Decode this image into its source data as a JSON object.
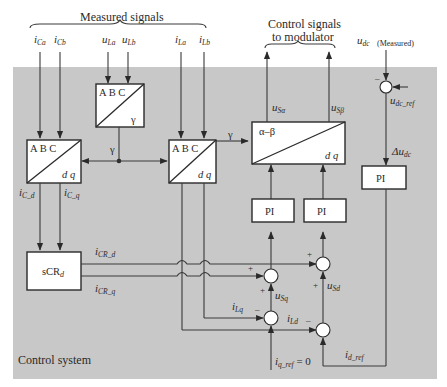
{
  "header": {
    "measured_signals": "Measured signals",
    "control_signals_line1": "Control signals",
    "control_signals_line2": "to modulator",
    "udc_measured_main": "u",
    "udc_measured_sub": "dc",
    "udc_measured_note": "(Measured)"
  },
  "region": {
    "label": "Control system",
    "background": "#c8c8c8"
  },
  "inputs": {
    "iCa": {
      "main": "i",
      "sub": "Ca"
    },
    "iCb": {
      "main": "i",
      "sub": "Cb"
    },
    "uLa": {
      "main": "u",
      "sub": "La"
    },
    "uLb": {
      "main": "u",
      "sub": "Lb"
    },
    "iLa": {
      "main": "i",
      "sub": "La"
    },
    "iLb": {
      "main": "i",
      "sub": "Lb"
    }
  },
  "blocks": {
    "pll": {
      "top": "A B C",
      "bottom": "γ"
    },
    "abc_dq_c": {
      "top": "A B C",
      "bottom": "d q"
    },
    "abc_dq_l": {
      "top": "A B C",
      "bottom": "d q"
    },
    "dq_ab": {
      "top": "α–β",
      "bottom": "d q"
    },
    "scr": {
      "main": "sCR",
      "sub": "d"
    },
    "pi_q": {
      "label": "PI"
    },
    "pi_d": {
      "label": "PI"
    },
    "pi_dc": {
      "label": "PI"
    }
  },
  "signals": {
    "gamma_left": "γ",
    "gamma_right": "γ",
    "iC_d": {
      "main": "i",
      "sub": "C_d"
    },
    "iC_q": {
      "main": "i",
      "sub": "C_q"
    },
    "iCR_d": {
      "main": "i",
      "sub": "CR_d"
    },
    "iCR_q": {
      "main": "i",
      "sub": "CR_q"
    },
    "uSa": {
      "main": "u",
      "sub": "Sα"
    },
    "uSb": {
      "main": "u",
      "sub": "Sβ"
    },
    "uSq": {
      "main": "u",
      "sub": "Sq"
    },
    "uSd": {
      "main": "u",
      "sub": "Sd"
    },
    "iLq": {
      "main": "i",
      "sub": "Lq"
    },
    "iLd": {
      "main": "i",
      "sub": "Ld"
    },
    "iq_ref": {
      "main": "i",
      "sub": "q_ref",
      "suffix": " = 0"
    },
    "id_ref": {
      "main": "i",
      "sub": "d_ref"
    },
    "udc_ref": {
      "main": "u",
      "sub": "dc_ref"
    },
    "delta_udc": {
      "main": "Δu",
      "sub": "dc"
    }
  },
  "signs": {
    "plus": "+",
    "minus": "–"
  }
}
